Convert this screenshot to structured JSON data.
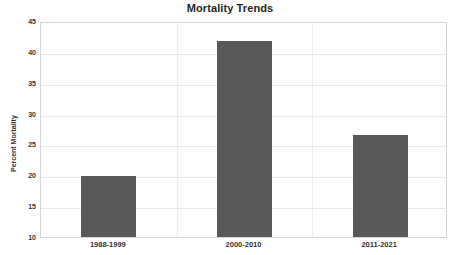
{
  "chart_data": {
    "type": "bar",
    "title": "Mortality Trends",
    "xlabel": "",
    "ylabel": "Percent Mortality",
    "categories": [
      "1988-1999",
      "2000-2010",
      "2011-2021"
    ],
    "values": [
      19.9,
      41.7,
      26.5
    ],
    "ylim": [
      10,
      45
    ],
    "yticks": [
      10,
      15,
      20,
      25,
      30,
      35,
      40,
      45
    ],
    "ytick_labels": [
      "10",
      "15",
      "20",
      "25",
      "30",
      "35",
      "40",
      "45"
    ],
    "grid": true,
    "legend": false,
    "bar_color": "#595959",
    "gridline_color": "#e8e8e8",
    "plot_border_color": "#d4d4d4",
    "background_color": "#ffffff"
  }
}
